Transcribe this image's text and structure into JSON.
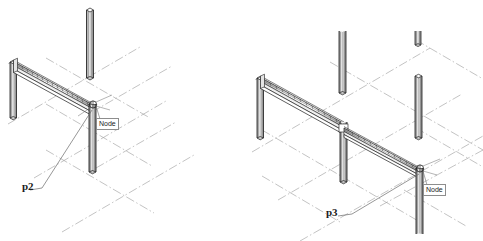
{
  "figure": {
    "type": "isometric-structural-cad",
    "background_color": "#ffffff",
    "line_color": "#1a1a1a",
    "grid_color": "#9a9a9a",
    "shade_color": "#b4b4b4",
    "panels": [
      {
        "id": "panel-left",
        "point_label": "p2",
        "node_label": "Node",
        "description": "Single-bay portal frame: short left column, diagonal isometric beam, tall right column"
      },
      {
        "id": "panel-right",
        "point_label": "p3",
        "node_label": "Node",
        "description": "Two-bay frame: left column, long beam to mid column, second beam continuing to right node column, plus free-standing columns on grid"
      }
    ]
  },
  "panel_left": {
    "point_label": "p2",
    "node_label": "Node",
    "columns": [
      {
        "name": "left-short-column"
      },
      {
        "name": "tall-back-column"
      },
      {
        "name": "right-node-column"
      }
    ],
    "beams": [
      {
        "name": "main-beam"
      }
    ]
  },
  "panel_right": {
    "point_label": "p3",
    "node_label": "Node",
    "columns": [
      {
        "name": "left-column"
      },
      {
        "name": "mid-column"
      },
      {
        "name": "back-tall-column"
      },
      {
        "name": "right-free-column"
      },
      {
        "name": "rear-stub-column"
      },
      {
        "name": "right-node-column"
      }
    ],
    "beams": [
      {
        "name": "upper-beam"
      },
      {
        "name": "lower-beam"
      }
    ]
  }
}
